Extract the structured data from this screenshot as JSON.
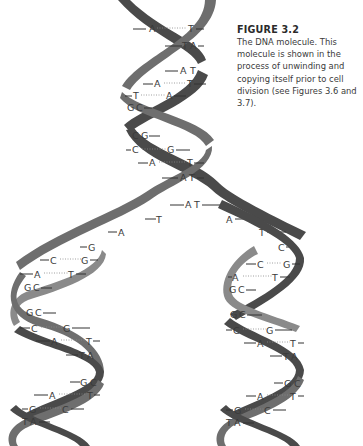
{
  "caption": {
    "title": "FIGURE 3.2",
    "body": "The DNA molecule. This molecule is shown in the process of unwinding and copying itself prior to cell division (see Figures 3.6 and 3.7)."
  },
  "diagram": {
    "ribbon_colors": {
      "dark": "#4a4a4a",
      "mid": "#6e6e6e",
      "light": "#8a8a8a"
    },
    "parent_helix_pairs": [
      {
        "left": "A",
        "right": "T"
      },
      {
        "left": "T",
        "right": "A"
      },
      {
        "left": "A",
        "right": "T"
      },
      {
        "left": "A",
        "right": "T"
      },
      {
        "left": "T",
        "right": "A"
      },
      {
        "left": "G",
        "right": "C"
      },
      {
        "left": "C",
        "right": "G"
      },
      {
        "left": "C",
        "right": "G"
      },
      {
        "left": "A",
        "right": "T"
      },
      {
        "left": "A",
        "right": "T"
      },
      {
        "left": "A",
        "right": "T"
      }
    ],
    "fork_unpaired": {
      "left_strand": [
        "T",
        "A",
        "G"
      ],
      "right_strand": [
        "A",
        "T",
        "C"
      ]
    },
    "left_daughter_pairs": [
      {
        "left": "C",
        "right": "G"
      },
      {
        "left": "A",
        "right": "T"
      },
      {
        "left": "G",
        "right": "C"
      },
      {
        "left": "G",
        "right": "C"
      },
      {
        "left": "C",
        "right": "G"
      },
      {
        "left": "A",
        "right": "T"
      },
      {
        "left": "T",
        "right": "A"
      },
      {
        "left": "G",
        "right": "C"
      },
      {
        "left": "A",
        "right": "T"
      },
      {
        "left": "G",
        "right": "C"
      },
      {
        "left": "T",
        "right": "A"
      }
    ],
    "right_daughter_pairs": [
      {
        "left": "C",
        "right": "G"
      },
      {
        "left": "A",
        "right": "T"
      },
      {
        "left": "G",
        "right": "C"
      },
      {
        "left": "G",
        "right": "C"
      },
      {
        "left": "C",
        "right": "G"
      },
      {
        "left": "A",
        "right": "T"
      },
      {
        "left": "T",
        "right": "A"
      },
      {
        "left": "G",
        "right": "C"
      },
      {
        "left": "A",
        "right": "T"
      },
      {
        "left": "G",
        "right": "C"
      },
      {
        "left": "T",
        "right": "A"
      }
    ]
  }
}
